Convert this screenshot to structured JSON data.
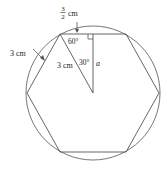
{
  "diagram": {
    "labels": {
      "half_side_num": "3",
      "half_side_den": "2",
      "half_side_unit": "cm",
      "side_label": "3 cm",
      "radius_label": "3 cm",
      "angle_vertex": "60°",
      "angle_center": "30°",
      "apothem": "a"
    },
    "colors": {
      "stroke": "#555555",
      "text": "#222222",
      "background": "#ffffff"
    }
  }
}
